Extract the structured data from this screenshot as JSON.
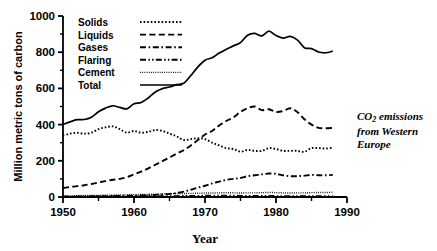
{
  "chart_data": {
    "type": "line",
    "title": "",
    "annotation": "CO2 emissions from Western Europe",
    "annotation_lines": [
      "CO",
      "2",
      " emissions",
      "from Western",
      "Europe"
    ],
    "xlabel": "Year",
    "ylabel": "Million metric tons of carbon",
    "xlim": [
      1950,
      1990
    ],
    "ylim": [
      0,
      1000
    ],
    "xticks": [
      1950,
      1960,
      1970,
      1980,
      1990
    ],
    "xtick_labels": [
      "1950",
      "1960",
      "1970",
      "1980",
      "1990"
    ],
    "xminor_step": 5,
    "yticks": [
      0,
      200,
      400,
      600,
      800,
      1000
    ],
    "ytick_labels": [
      "0",
      "200",
      "400",
      "600",
      "800",
      "1000"
    ],
    "yminor_step": 100,
    "grid": false,
    "legend_position": "top-left-inside",
    "x": [
      1950,
      1951,
      1952,
      1953,
      1954,
      1955,
      1956,
      1957,
      1958,
      1959,
      1960,
      1961,
      1962,
      1963,
      1964,
      1965,
      1966,
      1967,
      1968,
      1969,
      1970,
      1971,
      1972,
      1973,
      1974,
      1975,
      1976,
      1977,
      1978,
      1979,
      1980,
      1981,
      1982,
      1983,
      1984,
      1985,
      1986,
      1987,
      1988
    ],
    "series": [
      {
        "name": "Solids",
        "dash": "dotted",
        "values": [
          340,
          350,
          355,
          350,
          355,
          375,
          385,
          390,
          375,
          355,
          365,
          355,
          360,
          370,
          365,
          350,
          335,
          315,
          320,
          325,
          320,
          300,
          285,
          270,
          265,
          250,
          260,
          255,
          255,
          270,
          265,
          255,
          255,
          255,
          250,
          270,
          270,
          268,
          272
        ]
      },
      {
        "name": "Liquids",
        "dash": "dashed",
        "values": [
          50,
          55,
          60,
          65,
          72,
          80,
          88,
          95,
          100,
          110,
          125,
          140,
          158,
          178,
          198,
          218,
          240,
          258,
          285,
          315,
          345,
          365,
          395,
          420,
          440,
          470,
          490,
          500,
          480,
          485,
          470,
          475,
          490,
          470,
          430,
          400,
          382,
          380,
          382
        ]
      },
      {
        "name": "Gases",
        "dash": "dashdot",
        "values": [
          2,
          2,
          3,
          3,
          4,
          4,
          5,
          5,
          6,
          7,
          8,
          9,
          10,
          12,
          14,
          17,
          22,
          30,
          40,
          52,
          62,
          75,
          85,
          95,
          100,
          105,
          115,
          120,
          125,
          130,
          128,
          120,
          115,
          115,
          118,
          122,
          120,
          120,
          122
        ]
      },
      {
        "name": "Flaring",
        "dash": "dashdotdot",
        "values": [
          2,
          2,
          2,
          2,
          2,
          3,
          3,
          3,
          3,
          3,
          4,
          4,
          4,
          4,
          5,
          5,
          5,
          6,
          6,
          6,
          7,
          7,
          7,
          7,
          7,
          6,
          6,
          6,
          6,
          6,
          5,
          5,
          5,
          5,
          4,
          4,
          4,
          4,
          4
        ]
      },
      {
        "name": "Cement",
        "dash": "finedot",
        "values": [
          5,
          6,
          7,
          8,
          8,
          9,
          10,
          11,
          11,
          12,
          13,
          14,
          15,
          16,
          17,
          18,
          19,
          19,
          20,
          21,
          22,
          22,
          23,
          24,
          23,
          22,
          23,
          23,
          24,
          25,
          24,
          23,
          22,
          23,
          23,
          24,
          25,
          25,
          26
        ]
      },
      {
        "name": "Total",
        "dash": "solid",
        "values": [
          400,
          415,
          427,
          428,
          441,
          471,
          491,
          504,
          495,
          487,
          515,
          522,
          547,
          580,
          599,
          608,
          621,
          628,
          671,
          719,
          756,
          769,
          795,
          816,
          835,
          853,
          894,
          904,
          890,
          916,
          892,
          878,
          887,
          868,
          825,
          820,
          801,
          797,
          806
        ]
      }
    ],
    "legend": [
      {
        "label": "Solids",
        "dash": "dotted"
      },
      {
        "label": "Liquids",
        "dash": "dashed"
      },
      {
        "label": "Gases",
        "dash": "dashdot"
      },
      {
        "label": "Flaring",
        "dash": "dashdotdot"
      },
      {
        "label": "Cement",
        "dash": "finedot"
      },
      {
        "label": "Total",
        "dash": "solid"
      }
    ],
    "colors": {
      "line": "#000000",
      "axis": "#000000",
      "background": "#ffffff"
    }
  }
}
